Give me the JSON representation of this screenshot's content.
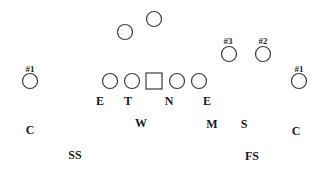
{
  "diagram": {
    "title": "",
    "offense": {
      "backs": [
        {
          "id": "back-1",
          "shape": "circle",
          "label": ""
        },
        {
          "id": "back-2",
          "shape": "circle",
          "label": ""
        }
      ],
      "receivers": [
        {
          "id": "receiver-left-1",
          "shape": "circle",
          "label": "#1"
        },
        {
          "id": "receiver-right-3",
          "shape": "circle",
          "label": "#3"
        },
        {
          "id": "receiver-right-2",
          "shape": "circle",
          "label": "#2"
        },
        {
          "id": "receiver-right-1",
          "shape": "circle",
          "label": "#1"
        }
      ],
      "line": [
        {
          "id": "tackle-left",
          "shape": "circle"
        },
        {
          "id": "guard-left",
          "shape": "circle"
        },
        {
          "id": "center",
          "shape": "square"
        },
        {
          "id": "guard-right",
          "shape": "circle"
        },
        {
          "id": "tackle-right",
          "shape": "circle"
        }
      ]
    },
    "defense": {
      "front": [
        "E",
        "T",
        "N",
        "E"
      ],
      "linebackers": [
        "W",
        "M",
        "S"
      ],
      "corners": [
        "C",
        "C"
      ],
      "safeties": [
        "SS",
        "FS"
      ]
    }
  }
}
